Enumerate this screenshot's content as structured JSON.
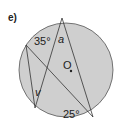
{
  "part_label": "e)",
  "diagram": {
    "circle": {
      "cx": 66,
      "cy": 70,
      "r": 47,
      "fill": "#cfcfcf",
      "stroke": "#555555"
    },
    "points": {
      "A": [
        62,
        18
      ],
      "B": [
        26,
        45
      ],
      "C": [
        35,
        108
      ],
      "D": [
        93,
        117
      ]
    },
    "segments": [
      [
        "A",
        "C"
      ],
      [
        "A",
        "D"
      ],
      [
        "B",
        "D"
      ],
      [
        "B",
        "C"
      ]
    ],
    "center_label": "O",
    "angles": {
      "a35": "35°",
      "a_var": "a",
      "v_var": "v",
      "a25": "25°"
    }
  }
}
